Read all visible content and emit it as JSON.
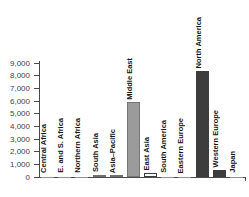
{
  "chart_data": {
    "type": "bar",
    "title": "",
    "xlabel": "",
    "ylabel": "",
    "grid": false,
    "legend": null,
    "ylim": [
      0,
      9000
    ],
    "yticks": [
      0,
      1000,
      2000,
      3000,
      4000,
      5000,
      6000,
      7000,
      8000,
      9000
    ],
    "ytick_labels": [
      "0",
      "1,000",
      "2,000",
      "3,000",
      "4,000",
      "5,000",
      "6,000",
      "7,000",
      "8,000",
      "9,000"
    ],
    "categories": [
      "Central Africa",
      "E. and S. Africa",
      "Northern Africa",
      "South Asia",
      "Asia–Pacific",
      "Middle East",
      "East Asia",
      "South America",
      "Eastern Europe",
      "North America",
      "Western Europe",
      "Japan"
    ],
    "values": [
      20,
      20,
      30,
      180,
      40,
      5900,
      300,
      30,
      40,
      8350,
      550,
      20
    ],
    "bar_fills": [
      "#8f8f8f",
      "#8f8f8f",
      "#8f8f8f",
      "#9b9b9b",
      "#9b9b9b",
      "#9b9b9b",
      "#fbfbfb",
      "#8f8f8f",
      "#8f8f8f",
      "#3d3d3d",
      "#3d3d3d",
      "#8f8f8f"
    ],
    "bar_borders": [
      "",
      "",
      "",
      "#6f6f6f",
      "#6f6f6f",
      "#777777",
      "#3d3d3d",
      "",
      "",
      "",
      "",
      ""
    ],
    "axis_color": "#4a4a4a",
    "label_color": "#141414"
  }
}
